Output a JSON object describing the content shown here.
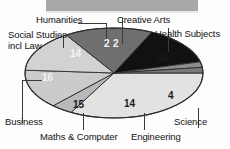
{
  "chart_data": {
    "type": "pie",
    "title": "",
    "subtitle": "",
    "xlabel": "",
    "ylabel": "",
    "legend_position": "none",
    "grid": false,
    "units": "percent",
    "total": 100,
    "categories": [
      "Health Subjects",
      "Science",
      "Engineering",
      "Maths & Computer",
      "Business",
      "Social Studies incl Law",
      "Humanities",
      "Creative Arts"
    ],
    "values": [
      33,
      4,
      14,
      15,
      16,
      14,
      2,
      2
    ],
    "slices": [
      {
        "label": "Health Subjects",
        "value": 33,
        "value_text": "33",
        "color": "#e2e2e2"
      },
      {
        "label": "Science",
        "value": 4,
        "value_text": "4",
        "color": "#b9b9b9"
      },
      {
        "label": "Engineering",
        "value": 14,
        "value_text": "14",
        "color": "#cbcbcb"
      },
      {
        "label": "Maths & Computer",
        "value": 15,
        "value_text": "15",
        "color": "#d2d2d2"
      },
      {
        "label": "Business",
        "value": 16,
        "value_text": "16",
        "color": "#6f6f6f"
      },
      {
        "label": "Social Studies incl Law",
        "value": 14,
        "value_text": "14",
        "color": "#111111"
      },
      {
        "label": "Humanities",
        "value": 2,
        "value_text": "2",
        "color": "#8d8d8d"
      },
      {
        "label": "Creative Arts",
        "value": 2,
        "value_text": "2",
        "color": "#7a7a7a"
      }
    ],
    "labels": {
      "humanities": "Humanities",
      "creative_arts": "Creative Arts",
      "health_subjects": "Health Subjects",
      "social_studies_line1": "Social Studies",
      "social_studies_line2": "incl Law",
      "business": "Business",
      "maths_computer": "Maths & Computer",
      "engineering": "Engineering",
      "science": "Science"
    },
    "slice_value_labels": {
      "health_subjects": "33",
      "science": "4",
      "engineering": "14",
      "maths_computer": "15",
      "business": "16",
      "social_studies": "14",
      "humanities": "2",
      "creative_arts": "2"
    }
  }
}
